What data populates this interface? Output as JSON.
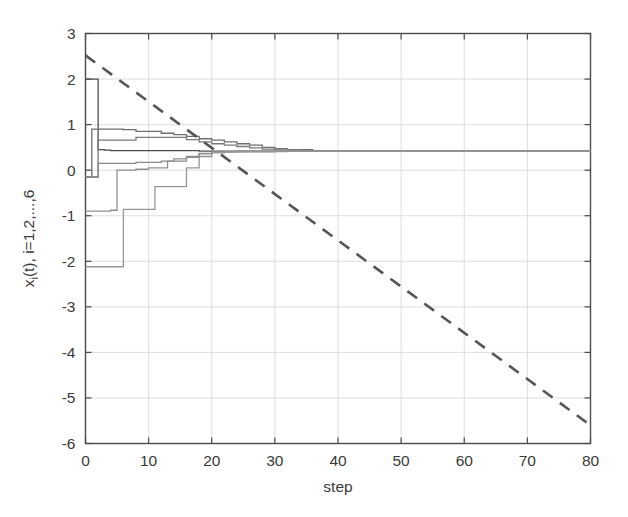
{
  "chart_data": {
    "type": "line",
    "title": "",
    "xlabel": "step",
    "ylabel": "x_i(t), i=1,2,...,6",
    "ylabel_parts": {
      "lead": "x",
      "sub": "i",
      "rest": "(t), i=1,2,...,6"
    },
    "xlim": [
      0,
      80
    ],
    "ylim": [
      -6,
      3
    ],
    "xticks": [
      0,
      10,
      20,
      30,
      40,
      50,
      60,
      70,
      80
    ],
    "yticks": [
      3,
      2,
      1,
      0,
      -1,
      -2,
      -3,
      -4,
      -5,
      -6
    ],
    "xticklabels": [
      "0",
      "10",
      "20",
      "30",
      "40",
      "50",
      "60",
      "70",
      "80"
    ],
    "yticklabels": [
      "3",
      "2",
      "1",
      "0",
      "-1",
      "-2",
      "-3",
      "-4",
      "-5",
      "-6"
    ],
    "grid": true,
    "grid_color": "#d9d9d9",
    "axis_color": "#4a4a4a",
    "background": "#ffffff",
    "legend": "none",
    "consensus_value": 0.42,
    "series": [
      {
        "name": "x_1(t)",
        "style": "solid",
        "color": "#4d4d4d",
        "linewidth": 1.3,
        "step": true,
        "x": [
          0,
          1,
          2,
          3,
          4,
          6,
          8,
          10,
          14,
          18,
          24,
          30,
          40,
          60,
          80
        ],
        "values": [
          2.0,
          2.0,
          0.45,
          0.44,
          0.43,
          0.43,
          0.43,
          0.43,
          0.43,
          0.42,
          0.42,
          0.42,
          0.42,
          0.42,
          0.42
        ]
      },
      {
        "name": "x_2(t)",
        "style": "solid",
        "color": "#6e6e6e",
        "linewidth": 1.3,
        "step": true,
        "x": [
          0,
          1,
          2,
          4,
          6,
          8,
          10,
          12,
          14,
          16,
          18,
          20,
          22,
          24,
          26,
          28,
          30,
          32,
          36,
          44,
          60,
          80
        ],
        "values": [
          -0.15,
          0.9,
          0.9,
          0.9,
          0.89,
          0.85,
          0.85,
          0.81,
          0.78,
          0.74,
          0.69,
          0.66,
          0.62,
          0.58,
          0.55,
          0.5,
          0.47,
          0.45,
          0.43,
          0.43,
          0.42,
          0.42
        ]
      },
      {
        "name": "x_3(t)",
        "style": "solid",
        "color": "#7a7a7a",
        "linewidth": 1.3,
        "step": true,
        "x": [
          0,
          2,
          4,
          6,
          8,
          10,
          12,
          14,
          16,
          18,
          20,
          22,
          24,
          26,
          28,
          30,
          34,
          40,
          60,
          80
        ],
        "values": [
          -0.15,
          0.66,
          0.66,
          0.66,
          0.72,
          0.72,
          0.72,
          0.72,
          0.67,
          0.62,
          0.58,
          0.55,
          0.52,
          0.49,
          0.46,
          0.44,
          0.43,
          0.42,
          0.42,
          0.42
        ]
      },
      {
        "name": "x_4(t)",
        "style": "solid",
        "color": "#8a8a8a",
        "linewidth": 1.3,
        "step": true,
        "x": [
          0,
          1,
          2,
          3,
          4,
          6,
          8,
          10,
          12,
          14,
          16,
          18,
          20,
          24,
          30,
          40,
          60,
          80
        ],
        "values": [
          -0.15,
          -0.15,
          0.15,
          0.15,
          0.15,
          0.15,
          0.17,
          0.17,
          0.2,
          0.2,
          0.28,
          0.37,
          0.4,
          0.41,
          0.42,
          0.42,
          0.42,
          0.42
        ]
      },
      {
        "name": "x_5(t)",
        "style": "solid",
        "color": "#8f8f8f",
        "linewidth": 1.3,
        "step": true,
        "x": [
          0,
          2,
          3,
          4,
          5,
          6,
          8,
          10,
          12,
          13,
          14,
          16,
          18,
          20,
          24,
          30,
          40,
          60,
          80
        ],
        "values": [
          -0.9,
          -0.9,
          -0.9,
          -0.88,
          0.0,
          0.0,
          0.02,
          0.05,
          0.05,
          0.2,
          0.25,
          0.3,
          0.36,
          0.4,
          0.41,
          0.42,
          0.42,
          0.42,
          0.42
        ]
      },
      {
        "name": "x_6(t)",
        "style": "solid",
        "color": "#969696",
        "linewidth": 1.3,
        "step": true,
        "x": [
          0,
          2,
          4,
          5,
          6,
          8,
          10,
          11,
          12,
          14,
          16,
          18,
          20,
          22,
          26,
          32,
          40,
          60,
          80
        ],
        "values": [
          -2.12,
          -2.12,
          -2.12,
          -2.12,
          -0.86,
          -0.86,
          -0.86,
          -0.36,
          -0.36,
          -0.36,
          0.05,
          0.3,
          0.38,
          0.4,
          0.41,
          0.42,
          0.42,
          0.42,
          0.42
        ]
      },
      {
        "name": "reference",
        "style": "dashed",
        "color": "#555555",
        "linewidth": 2.6,
        "step": false,
        "x": [
          0,
          80
        ],
        "values": [
          2.52,
          -5.6
        ]
      }
    ]
  }
}
